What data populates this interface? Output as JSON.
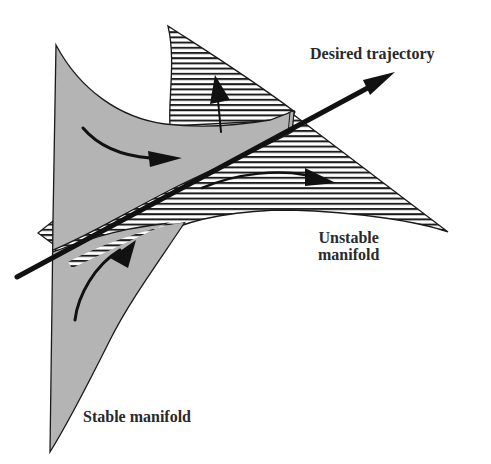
{
  "figure": {
    "colors": {
      "stable_fill": "#b4b4b4",
      "outline": "#1a1a1a",
      "hatch": "#1e1e1e",
      "background": "#ffffff",
      "text": "#2a2a2a"
    },
    "labels": {
      "desired_trajectory": "Desired trajectory",
      "unstable_manifold_line1": "Unstable",
      "unstable_manifold_line2": "manifold",
      "stable_manifold": "Stable manifold"
    },
    "elements": {
      "stable_manifold": {
        "style": "gray-filled surface",
        "flow_direction": "toward trajectory"
      },
      "unstable_manifold": {
        "style": "horizontal-hatched surface",
        "flow_direction": "away from trajectory"
      },
      "trajectory": {
        "style": "thick arrow"
      }
    }
  }
}
